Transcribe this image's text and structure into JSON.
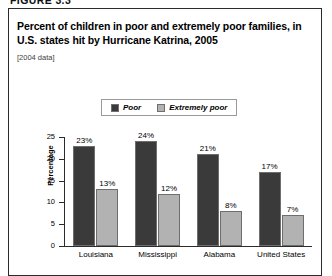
{
  "figure_header": "FIGURE 3.3",
  "figure": {
    "title": "Percent of children in poor and extremely poor families, in U.S. states hit by Hurricane Katrina, 2005",
    "subtitle": "[2004 data]"
  },
  "legend": {
    "items": [
      {
        "label": "Poor",
        "color": "#3a3a3a"
      },
      {
        "label": "Extremely poor",
        "color": "#b2b2b2"
      }
    ]
  },
  "axes": {
    "y_title": "Percentage",
    "y_ticks": [
      "25",
      "20",
      "15",
      "10",
      "5",
      "0"
    ]
  },
  "chart_data": {
    "type": "bar",
    "title": "Percent of children in poor and extremely poor families, in U.S. states hit by Hurricane Katrina, 2005",
    "subtitle": "[2004 data]",
    "xlabel": "",
    "ylabel": "Percentage",
    "ylim": [
      0,
      25
    ],
    "ytick_interval": 5,
    "grid": false,
    "legend_position": "top-center",
    "categories": [
      "Louisiana",
      "Mississippi",
      "Alabama",
      "United States"
    ],
    "series": [
      {
        "name": "Poor",
        "color": "#3a3a3a",
        "values": [
          23,
          24,
          21,
          17
        ],
        "labels": [
          "23%",
          "24%",
          "21%",
          "17%"
        ]
      },
      {
        "name": "Extremely poor",
        "color": "#b2b2b2",
        "values": [
          13,
          12,
          8,
          7
        ],
        "labels": [
          "13%",
          "12%",
          "8%",
          "7%"
        ]
      }
    ]
  }
}
